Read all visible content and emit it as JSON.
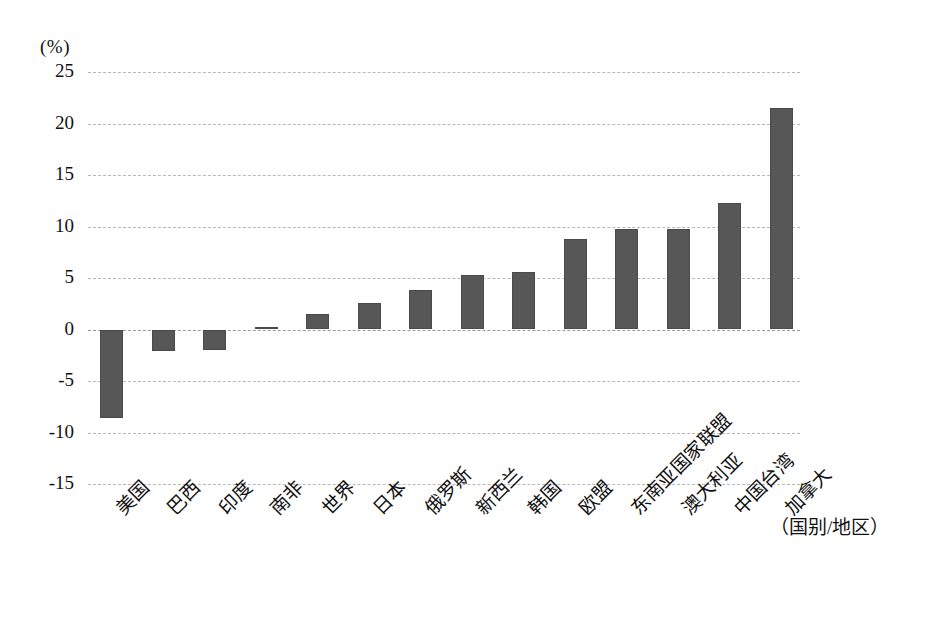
{
  "chart_data": {
    "type": "bar",
    "title": "",
    "subtitle": "",
    "unit_label": "(%)",
    "xlabel": "（国别/地区）",
    "ylabel": "(%)",
    "ylim": [
      -15,
      25
    ],
    "ytick_labels": [
      "25",
      "20",
      "15",
      "10",
      "5",
      "0",
      "-5",
      "-10",
      "-15"
    ],
    "ytick_values": [
      25,
      20,
      15,
      10,
      5,
      0,
      -5,
      -10,
      -15
    ],
    "grid": true,
    "legend": "none",
    "categories": [
      "美国",
      "巴西",
      "印度",
      "南非",
      "世界",
      "日本",
      "俄罗斯",
      "新西兰",
      "韩国",
      "欧盟",
      "东南亚国家联盟",
      "澳大利亚",
      "中国台湾",
      "加拿大"
    ],
    "values": [
      -8.6,
      -2.1,
      -2.0,
      0.2,
      1.5,
      2.6,
      3.8,
      5.3,
      5.6,
      8.8,
      9.8,
      9.8,
      12.3,
      21.5
    ],
    "series": [
      {
        "name": "",
        "values": [
          -8.6,
          -2.1,
          -2.0,
          0.2,
          1.5,
          2.6,
          3.8,
          5.3,
          5.6,
          8.8,
          9.8,
          9.8,
          12.3,
          21.5
        ]
      }
    ],
    "colors": {
      "bar": "#575757",
      "gridline": "#b8b8b8",
      "background": "#ffffff",
      "text": "#111111"
    }
  }
}
